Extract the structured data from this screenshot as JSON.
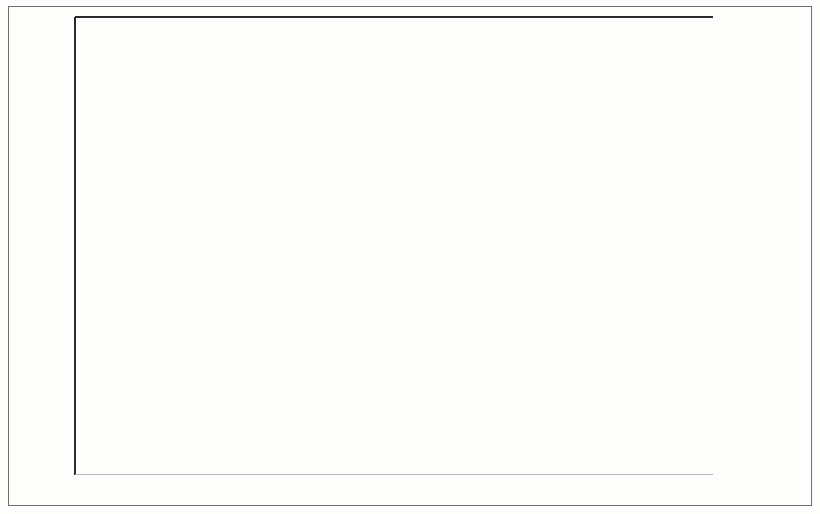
{
  "chart_data": {
    "type": "bar",
    "subtype": "stacked-bar",
    "title": "",
    "xlabel": "",
    "ylabel": "PERCENT OF TOTAL SAMPLE",
    "ylim": [
      0,
      50
    ],
    "yticks": [
      0,
      10,
      20,
      30,
      40,
      50
    ],
    "ytick_labels": [
      "0",
      "10",
      "20",
      "30",
      "40",
      "50"
    ],
    "grid": "horizontal-stubs",
    "legend_position": "right",
    "categories": [
      "CPEA-ADI CRITERIA",
      "ADI-SOCIAL: STANDARD CUTOFF",
      "ADI-COMMUNICATION: STANDARD CUTOFF",
      "ADI-RRB: STANDARD CUTOFF"
    ],
    "category_lines": [
      [
        "CPEA-ADI CRITERIA"
      ],
      [
        "ADI-SOCIAL:",
        "STANDARD CUTOFF"
      ],
      [
        "ADI-COMMUNICATION:",
        "STANDARD CUTOFF"
      ],
      [
        "ADI-RRB:",
        "STANDARD CUTOFF"
      ]
    ],
    "series": [
      {
        "name": "Non-ASD",
        "color": "#8c8c8c",
        "values": [
          19.8,
          19.8,
          19.8,
          30.6
        ]
      },
      {
        "name": "CPEA-ASD",
        "color": "#dcdcdc",
        "values": [
          17.7,
          16.0,
          12.5,
          15.9
        ]
      }
    ],
    "totals": [
      37.5,
      35.8,
      32.3,
      46.5
    ],
    "stack_order_bottom_to_top": [
      "Non-ASD",
      "CPEA-ASD"
    ]
  },
  "legend": {
    "items": [
      {
        "label": "CPEA-ASD",
        "swatch": "light"
      },
      {
        "label": "Non-ASD",
        "swatch": "dark"
      }
    ]
  },
  "axes": {
    "y_title": "PERCENT OF TOTAL SAMPLE"
  }
}
